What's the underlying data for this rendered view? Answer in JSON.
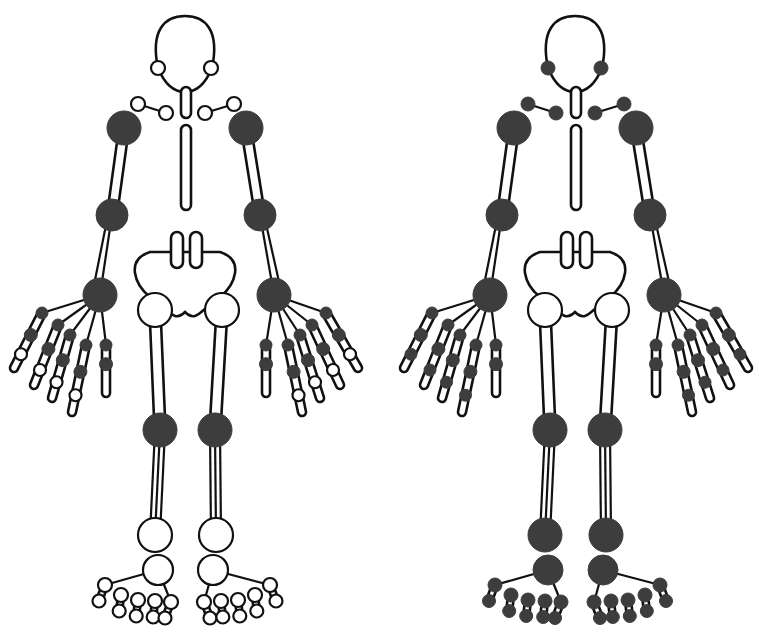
{
  "diagram": {
    "type": "homunculus-joint-chart",
    "colors": {
      "affected": "#3d3d3d",
      "unaffected": "#ffffff",
      "outline": "#111111",
      "background": "#ffffff"
    },
    "figures": [
      {
        "id": "left-figure",
        "offset_x": 0,
        "affected_joints": [
          "shoulders",
          "elbows",
          "wrists",
          "hand_mcp",
          "hand_pip",
          "knees"
        ],
        "unaffected_joints": [
          "temporomandibular",
          "sternoclavicular",
          "acromioclavicular",
          "hips",
          "hand_dip",
          "ankles",
          "midfoot",
          "toes_mtp",
          "toes_ip"
        ]
      },
      {
        "id": "right-figure",
        "offset_x": 390,
        "affected_joints": [
          "temporomandibular",
          "sternoclavicular",
          "acromioclavicular",
          "shoulders",
          "elbows",
          "wrists",
          "hand_mcp",
          "hand_pip",
          "hand_dip",
          "knees",
          "ankles",
          "midfoot",
          "toes_mtp",
          "toes_ip"
        ],
        "unaffected_joints": [
          "hips"
        ]
      }
    ]
  }
}
